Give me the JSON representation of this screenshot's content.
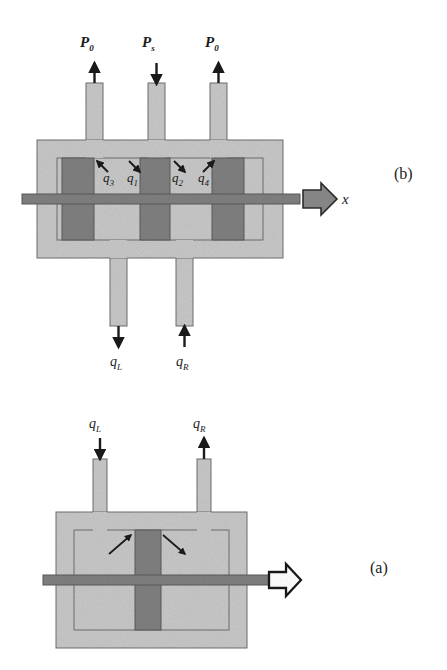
{
  "figure": {
    "type": "technical-diagram",
    "background_color": "#ffffff",
    "body_fill": "#c8c8c8",
    "spool_fill": "#808080",
    "rod_fill": "#808080",
    "outline_color": "#6e6e6e",
    "ink_color": "#1a1a1a"
  },
  "panels": [
    {
      "id": "b",
      "tag": "(b)",
      "title_absent": true,
      "description": "Four-way spool valve with three top ports and two bottom ports",
      "top_ports": [
        {
          "name": "port-left-return",
          "label": "P",
          "sub": "0",
          "flow_direction": "up",
          "arrow": "up"
        },
        {
          "name": "port-center-supply",
          "label": "P",
          "sub": "s",
          "flow_direction": "down",
          "arrow": "down"
        },
        {
          "name": "port-right-return",
          "label": "P",
          "sub": "0",
          "flow_direction": "up",
          "arrow": "up"
        }
      ],
      "bottom_ports": [
        {
          "name": "port-load-left",
          "label": "q",
          "sub": "L",
          "flow_direction": "down",
          "arrow": "down"
        },
        {
          "name": "port-load-right",
          "label": "q",
          "sub": "R",
          "flow_direction": "up",
          "arrow": "up"
        }
      ],
      "orifice_flows": [
        {
          "name": "orifice-q3",
          "label": "q",
          "sub": "3",
          "arrow": "up-left"
        },
        {
          "name": "orifice-q1",
          "label": "q",
          "sub": "1",
          "arrow": "down-left"
        },
        {
          "name": "orifice-q2",
          "label": "q",
          "sub": "2",
          "arrow": "down-right"
        },
        {
          "name": "orifice-q4",
          "label": "q",
          "sub": "4",
          "arrow": "up-right"
        }
      ],
      "motion": {
        "name": "spool-displacement",
        "label": "x",
        "arrow_style": "solid-filled",
        "direction": "right"
      },
      "spool_lands": 3
    },
    {
      "id": "a",
      "tag": "(a)",
      "description": "Double-acting hydraulic cylinder with piston and rod",
      "top_ports": [
        {
          "name": "port-inlet-left",
          "label": "q",
          "sub": "L",
          "flow_direction": "down",
          "arrow": "down"
        },
        {
          "name": "port-outlet-right",
          "label": "q",
          "sub": "R",
          "flow_direction": "up",
          "arrow": "up"
        }
      ],
      "chamber_flow_arrows": [
        {
          "name": "flow-arrow-left-chamber",
          "direction": "up-right"
        },
        {
          "name": "flow-arrow-right-chamber",
          "direction": "down-right"
        }
      ],
      "motion": {
        "name": "piston-displacement",
        "arrow_style": "hollow-outline",
        "direction": "right",
        "label": ""
      },
      "piston": {
        "name": "piston-block"
      },
      "rod": {
        "name": "piston-rod"
      }
    }
  ]
}
